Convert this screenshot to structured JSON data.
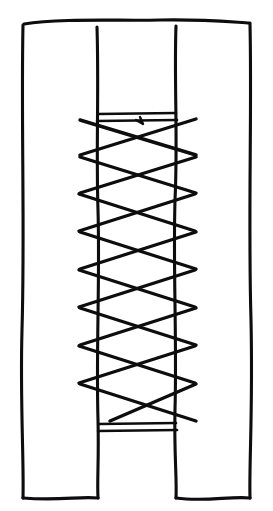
{
  "figure": {
    "style": "hand-drawn black ink line art on white",
    "background_color": "#ffffff",
    "ink_color": "#0d0d0d",
    "canvas": {
      "width": 273,
      "height": 511
    }
  },
  "geometry": {
    "left_panel": {
      "name": "left-panel",
      "outer_edge_x": 23,
      "inner_edge_x": 97,
      "top_y": 24,
      "bottom_y": 498
    },
    "right_panel": {
      "name": "right-panel",
      "inner_edge_x": 176,
      "outer_edge_x": 250,
      "top_y": 24,
      "bottom_y": 498
    },
    "gap": {
      "name": "center-gap",
      "left_x": 97,
      "right_x": 176,
      "lacing_top_y": 120,
      "lacing_bottom_y": 428
    },
    "top_edge_y": 22,
    "bottom_edge_y": 499
  },
  "outlines": {
    "top_rail": "M 24 24 C 60 18, 120 21, 160 20 C 200 19, 232 22, 250 23",
    "left_outer": "M 23 25 C 21 120, 25 230, 22 330 C 20 400, 24 460, 23 498",
    "left_inner": "M 97 27 C 99 90, 96 150, 98 210 C 100 280, 96 350, 98 420 C 99 460, 97 480, 98 498",
    "right_inner": "M 176 26 C 174 80, 178 140, 175 200 C 173 270, 177 340, 175 410 C 174 455, 177 478, 176 498",
    "right_outer": "M 250 24 C 252 110, 248 220, 251 320 C 253 410, 249 465, 250 498",
    "left_bottom": "M 23 498 C 60 501, 80 496, 98 498",
    "right_bottom": "M 176 498 C 205 502, 230 496, 250 498"
  },
  "bands": [
    {
      "name": "top-band-upper",
      "x1": 98,
      "y1": 114,
      "x2": 176,
      "y2": 113
    },
    {
      "name": "top-band-lower",
      "x1": 97,
      "y1": 121,
      "x2": 177,
      "y2": 120
    },
    {
      "name": "bottom-band-upper",
      "x1": 99,
      "y1": 424,
      "x2": 176,
      "y2": 423
    },
    {
      "name": "bottom-band-lower",
      "x1": 98,
      "y1": 431,
      "x2": 177,
      "y2": 430
    }
  ],
  "lacing": {
    "name": "cross-lacing",
    "crossing_count": 8,
    "overhang_left_x": 78,
    "overhang_right_x": 194,
    "rung_spacing_px": 38,
    "strand_down_right": [
      {
        "x1": 80,
        "y1": 120,
        "x2": 196,
        "y2": 155
      },
      {
        "x1": 80,
        "y1": 157,
        "x2": 196,
        "y2": 193
      },
      {
        "x1": 79,
        "y1": 194,
        "x2": 195,
        "y2": 231
      },
      {
        "x1": 80,
        "y1": 232,
        "x2": 196,
        "y2": 269
      },
      {
        "x1": 79,
        "y1": 270,
        "x2": 195,
        "y2": 307
      },
      {
        "x1": 80,
        "y1": 308,
        "x2": 196,
        "y2": 345
      },
      {
        "x1": 79,
        "y1": 346,
        "x2": 195,
        "y2": 383
      },
      {
        "x1": 80,
        "y1": 384,
        "x2": 196,
        "y2": 421
      }
    ],
    "strand_up_right": [
      {
        "x1": 80,
        "y1": 155,
        "x2": 196,
        "y2": 119
      },
      {
        "x1": 80,
        "y1": 193,
        "x2": 196,
        "y2": 157
      },
      {
        "x1": 79,
        "y1": 231,
        "x2": 195,
        "y2": 194
      },
      {
        "x1": 80,
        "y1": 269,
        "x2": 196,
        "y2": 232
      },
      {
        "x1": 79,
        "y1": 307,
        "x2": 195,
        "y2": 270
      },
      {
        "x1": 80,
        "y1": 345,
        "x2": 196,
        "y2": 308
      },
      {
        "x1": 79,
        "y1": 383,
        "x2": 195,
        "y2": 346
      },
      {
        "x1": 110,
        "y1": 421,
        "x2": 196,
        "y2": 384
      }
    ]
  },
  "knot_mark": {
    "name": "knot-tick",
    "description": "small hooked tick mark just below the top band, near horizontal center",
    "path": "M 136 120 L 143 124 M 143 124 L 140 117"
  }
}
